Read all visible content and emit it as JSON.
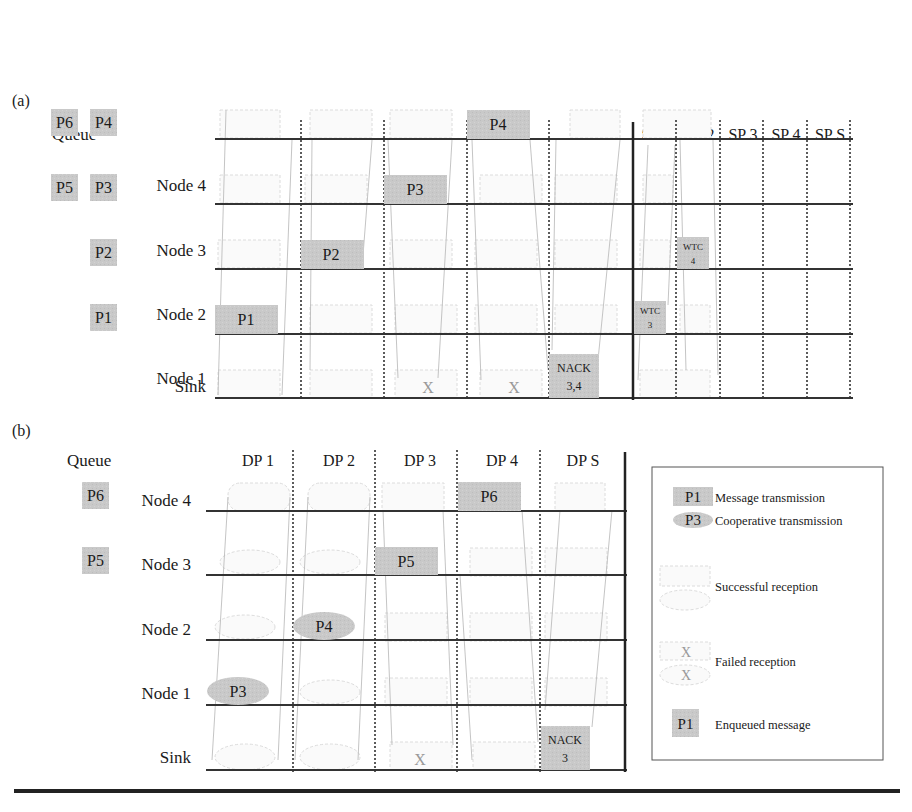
{
  "panel_a": {
    "label": "(a)",
    "queue_title": "Queue",
    "queue": [
      {
        "row": "Node 4",
        "items": [
          "P6",
          "P4"
        ]
      },
      {
        "row": "Node 3",
        "items": [
          "P5",
          "P3"
        ]
      },
      {
        "row": "Node 2",
        "items": [
          "P2"
        ]
      },
      {
        "row": "Node 1",
        "items": [
          "P1"
        ]
      }
    ],
    "rows": [
      "Node 4",
      "Node 3",
      "Node 2",
      "Node 1",
      "Sink"
    ],
    "columns": [
      "DP 1",
      "DP 2",
      "DP 3",
      "DP 4",
      "DP S",
      "SP 1",
      "SP 2",
      "SP 3",
      "SP 4",
      "SP S"
    ],
    "transmissions": [
      {
        "col": "DP 1",
        "row": "Node 1",
        "text": "P1",
        "type": "message"
      },
      {
        "col": "DP 2",
        "row": "Node 2",
        "text": "P2",
        "type": "message"
      },
      {
        "col": "DP 3",
        "row": "Node 3",
        "text": "P3",
        "type": "message"
      },
      {
        "col": "DP 4",
        "row": "Node 4",
        "text": "P4",
        "type": "message"
      },
      {
        "col": "DP S",
        "row": "Sink",
        "text": "NACK 3,4",
        "line1": "NACK",
        "line2": "3,4",
        "type": "message"
      },
      {
        "col": "SP 1",
        "row": "Node 1",
        "text": "WTC 3",
        "line1": "WTC",
        "line2": "3",
        "type": "message"
      },
      {
        "col": "SP 2",
        "row": "Node 2",
        "text": "WTC 4",
        "line1": "WTC",
        "line2": "4",
        "type": "message"
      }
    ],
    "failed": [
      {
        "col": "DP 3",
        "row": "Sink",
        "text": "X"
      },
      {
        "col": "DP 4",
        "row": "Sink",
        "text": "X"
      }
    ]
  },
  "panel_b": {
    "label": "(b)",
    "queue_title": "Queue",
    "queue": [
      {
        "row": "Node 4",
        "items": [
          "P6"
        ]
      },
      {
        "row": "Node 3",
        "items": [
          "P5"
        ]
      }
    ],
    "rows": [
      "Node 4",
      "Node 3",
      "Node 2",
      "Node 1",
      "Sink"
    ],
    "columns": [
      "DP 1",
      "DP 2",
      "DP 3",
      "DP 4",
      "DP S"
    ],
    "transmissions": [
      {
        "col": "DP 1",
        "row": "Node 1",
        "text": "P3",
        "type": "cooperative"
      },
      {
        "col": "DP 2",
        "row": "Node 2",
        "text": "P4",
        "type": "cooperative"
      },
      {
        "col": "DP 3",
        "row": "Node 3",
        "text": "P5",
        "type": "message"
      },
      {
        "col": "DP 4",
        "row": "Node 4",
        "text": "P6",
        "type": "message"
      },
      {
        "col": "DP S",
        "row": "Sink",
        "text": "NACK 3",
        "line1": "NACK",
        "line2": "3",
        "type": "message"
      }
    ],
    "failed": [
      {
        "col": "DP 3",
        "row": "Sink",
        "text": "X"
      }
    ]
  },
  "legend": {
    "items": [
      {
        "symbol": "P1",
        "shape": "rect",
        "label": "Message transmission"
      },
      {
        "symbol": "P3",
        "shape": "ellipse",
        "label": "Cooperative transmission"
      },
      {
        "symbol": "",
        "shape": "faint-rect-ellipse",
        "label": "Successful reception"
      },
      {
        "symbol": "X",
        "shape": "faint-x",
        "label": "Failed reception"
      },
      {
        "symbol": "P1",
        "shape": "queue-rect",
        "label": "Enqueued message"
      }
    ]
  },
  "colors": {
    "fill": "#c8c8c8",
    "line": "#333333",
    "faint": "#dddddd"
  }
}
